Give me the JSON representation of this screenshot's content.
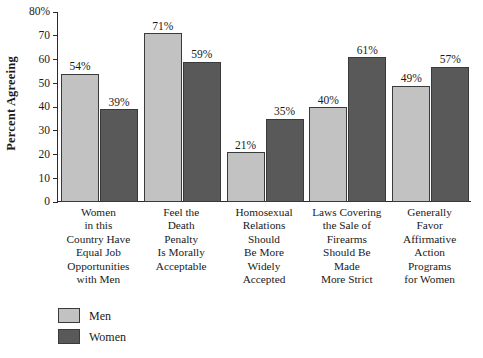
{
  "chart_data": {
    "type": "bar",
    "title": "",
    "xlabel": "",
    "ylabel": "Percent Agreeing",
    "ylim": [
      0,
      80
    ],
    "grid": false,
    "legend_position": "bottom-left",
    "y_ticks": [
      "80%",
      "70",
      "60",
      "50",
      "40",
      "30",
      "20",
      "10",
      "0"
    ],
    "y_tick_values": [
      80,
      70,
      60,
      50,
      40,
      30,
      20,
      10,
      0
    ],
    "categories": [
      "Women\nin this\nCountry Have\nEqual Job\nOpportunities\nwith Men",
      "Feel the\nDeath\nPenalty\nIs Morally\nAcceptable",
      "Homosexual\nRelations\nShould\nBe More\nWidely\nAccepted",
      "Laws Covering\nthe Sale of\nFirearms\nShould Be\nMade\nMore Strict",
      "Generally\nFavor\nAffirmative\nAction\nPrograms\nfor Women"
    ],
    "series": [
      {
        "name": "Men",
        "color": "#c2c2c2",
        "values": [
          54,
          71,
          21,
          40,
          49
        ],
        "labels": [
          "54%",
          "71%",
          "21%",
          "40%",
          "49%"
        ]
      },
      {
        "name": "Women",
        "color": "#595959",
        "values": [
          39,
          59,
          35,
          61,
          57
        ],
        "labels": [
          "39%",
          "59%",
          "35%",
          "61%",
          "57%"
        ]
      }
    ]
  },
  "legend": {
    "items": [
      {
        "label": "Men"
      },
      {
        "label": "Women"
      }
    ]
  }
}
